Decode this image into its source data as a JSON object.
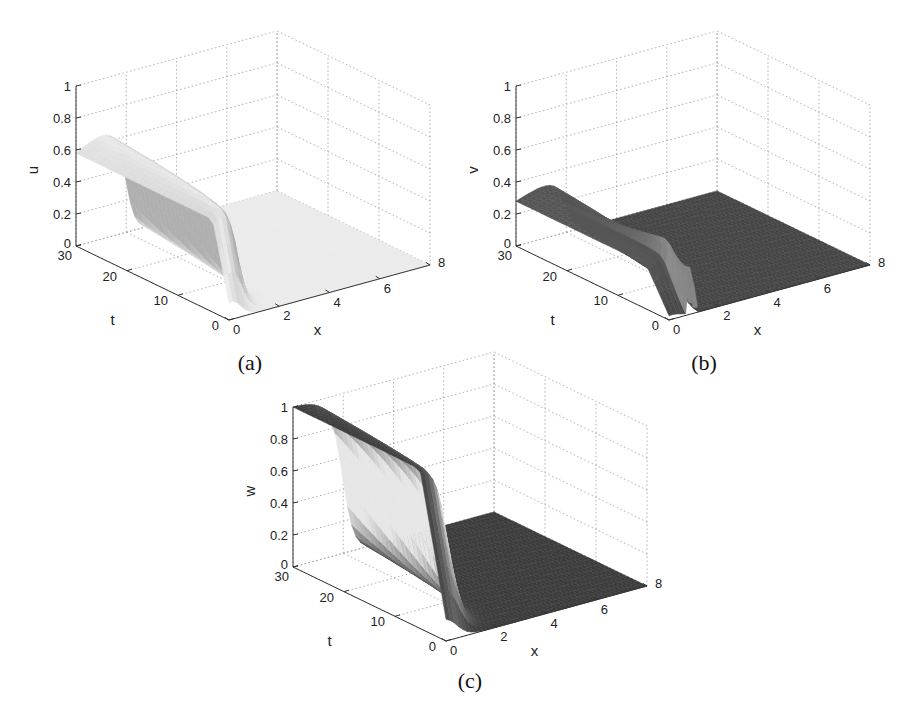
{
  "figure": {
    "panels": [
      {
        "id": "a",
        "caption": "(a)",
        "zlabel": "u",
        "xlabel": "x",
        "tlabel": "t"
      },
      {
        "id": "b",
        "caption": "(b)",
        "zlabel": "v",
        "xlabel": "x",
        "tlabel": "t"
      },
      {
        "id": "c",
        "caption": "(c)",
        "zlabel": "w",
        "xlabel": "x",
        "tlabel": "t"
      }
    ]
  },
  "chart_data": [
    {
      "type": "surface3d",
      "panel": "(a)",
      "zlabel": "u",
      "xlabel": "x",
      "ylabel": "t",
      "xlim": [
        0,
        8
      ],
      "tlim": [
        0,
        30
      ],
      "zlim": [
        0,
        1
      ],
      "xticks": [
        "0",
        "2",
        "4",
        "6",
        "8"
      ],
      "tticks": [
        "0",
        "10",
        "20",
        "30"
      ],
      "zticks": [
        "0",
        "0.2",
        "0.4",
        "0.6",
        "0.8",
        "1"
      ],
      "grid": true,
      "description": "Traveling front: u ≈ 0.58 at x=0 for t=30, rising to ~0.65 plateau, dropping steeply to 0 near x≈2; zero for x>2. Front position grows with t.",
      "value_at_x0_t30": 0.58,
      "plateau_max": 0.65,
      "front_x_at_t30": 2.0,
      "shade": "light"
    },
    {
      "type": "surface3d",
      "panel": "(b)",
      "zlabel": "v",
      "xlabel": "x",
      "ylabel": "t",
      "xlim": [
        0,
        8
      ],
      "tlim": [
        0,
        30
      ],
      "zlim": [
        0,
        1
      ],
      "xticks": [
        "0",
        "2",
        "4",
        "6",
        "8"
      ],
      "tticks": [
        "0",
        "10",
        "20",
        "30"
      ],
      "zticks": [
        "0",
        "0.2",
        "0.4",
        "0.6",
        "0.8",
        "1"
      ],
      "grid": true,
      "description": "v ≈ 0.28 at x=0,t=30 with a broad low bulge (~0.3) and a sharp narrow spike (~0.55) near x≈1 at small t; zero beyond the front.",
      "value_at_x0_t30": 0.28,
      "spike_peak": 0.55,
      "front_x_at_t30": 2.0,
      "shade": "dark"
    },
    {
      "type": "surface3d",
      "panel": "(c)",
      "zlabel": "w",
      "xlabel": "x",
      "ylabel": "t",
      "xlim": [
        0,
        8
      ],
      "tlim": [
        0,
        30
      ],
      "zlim": [
        0,
        1
      ],
      "xticks": [
        "0",
        "2",
        "4",
        "6",
        "8"
      ],
      "tticks": [
        "0",
        "10",
        "20",
        "30"
      ],
      "zticks": [
        "0",
        "0.2",
        "0.4",
        "0.6",
        "0.8",
        "1"
      ],
      "grid": true,
      "description": "w ≈ 1 at x=0,t=30, decaying through a front to 0 near x≈2; zero for x>2.",
      "value_at_x0_t30": 1.0,
      "front_x_at_t30": 2.0,
      "shade": "dark-top"
    }
  ]
}
